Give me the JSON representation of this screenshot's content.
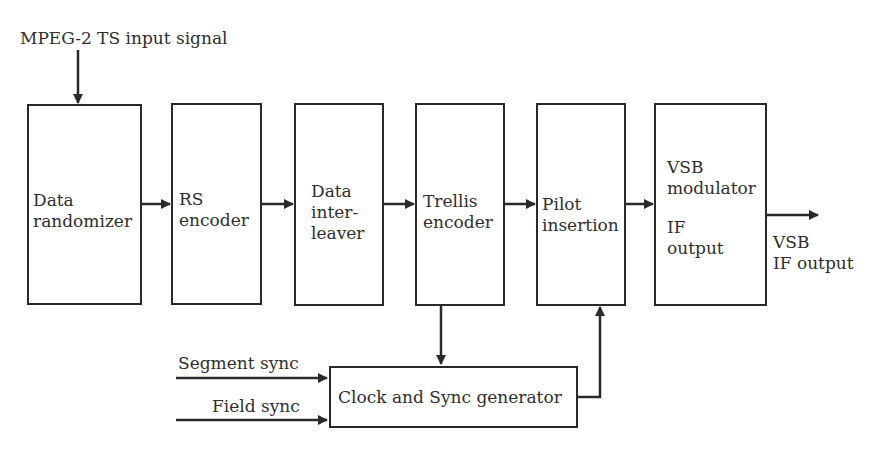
{
  "diagram": {
    "type": "block-diagram",
    "input_label": "MPEG-2 TS  input signal",
    "blocks": [
      {
        "id": "data-randomizer",
        "lines": [
          "Data",
          "randomizer"
        ]
      },
      {
        "id": "rs-encoder",
        "lines": [
          "RS",
          "encoder"
        ]
      },
      {
        "id": "data-interleaver",
        "lines": [
          "Data",
          "inter-",
          "leaver"
        ]
      },
      {
        "id": "trellis-encoder",
        "lines": [
          "Trellis",
          "encoder"
        ]
      },
      {
        "id": "pilot-insertion",
        "lines": [
          "Pilot",
          "insertion"
        ]
      },
      {
        "id": "vsb-modulator",
        "lines": [
          "VSB",
          "modulator",
          "",
          "IF",
          "output"
        ]
      }
    ],
    "output_label": [
      "VSB",
      "IF output"
    ],
    "sync_generator": {
      "label": "Clock and Sync generator"
    },
    "sync_inputs": [
      "Segment sync",
      "Field sync"
    ],
    "colors": {
      "line": "#2a2a2a",
      "background": "#ffffff"
    }
  }
}
